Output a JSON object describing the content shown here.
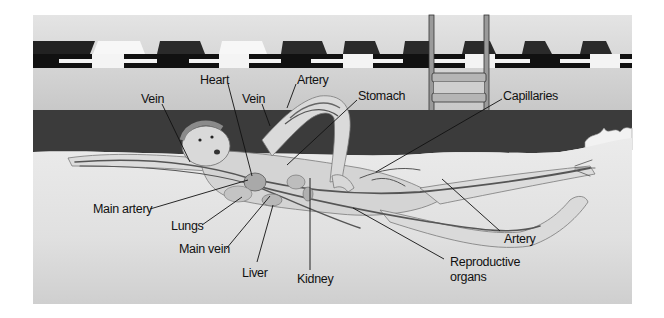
{
  "diagram": {
    "colors": {
      "page_bg": "#ffffff",
      "wall": "#cfcfcf",
      "wall_top": "#e2e2e2",
      "water_dark": "#3a3a3a",
      "underwater": "#e6e6e6",
      "vessel": "#5a5a5a",
      "skin": "#d9d9d9",
      "leader_line": "#111111"
    },
    "labels": [
      {
        "id": "vein-left",
        "text": "Vein",
        "x": 141,
        "y": 92
      },
      {
        "id": "heart",
        "text": "Heart",
        "x": 200,
        "y": 73
      },
      {
        "id": "vein-arm",
        "text": "Vein",
        "x": 242,
        "y": 92
      },
      {
        "id": "artery-arm",
        "text": "Artery",
        "x": 297,
        "y": 73
      },
      {
        "id": "stomach",
        "text": "Stomach",
        "x": 358,
        "y": 89
      },
      {
        "id": "capillaries",
        "text": "Capillaries",
        "x": 503,
        "y": 89
      },
      {
        "id": "main-artery",
        "text": "Main artery",
        "x": 93,
        "y": 202
      },
      {
        "id": "lungs",
        "text": "Lungs",
        "x": 171,
        "y": 219
      },
      {
        "id": "main-vein",
        "text": "Main vein",
        "x": 179,
        "y": 242
      },
      {
        "id": "liver",
        "text": "Liver",
        "x": 242,
        "y": 266
      },
      {
        "id": "kidney",
        "text": "Kidney",
        "x": 297,
        "y": 272
      },
      {
        "id": "artery-leg",
        "text": "Artery",
        "x": 504,
        "y": 232
      },
      {
        "id": "reproductive-organs",
        "text": "Reproductive",
        "text2": "organs",
        "x": 450,
        "y": 255
      }
    ]
  }
}
